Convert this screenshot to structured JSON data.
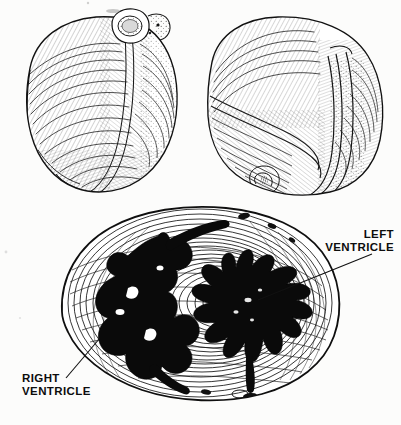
{
  "plate": {
    "title": "Heart Anatomy Illustration Plate",
    "medium": "pen-and-ink hatched anatomical drawing",
    "background_color": "#fcfcfb",
    "ink_color": "#141414",
    "cavity_fill_color": "#0a0a0a"
  },
  "figures": {
    "top_left": {
      "name": "heart-specimen-anterior",
      "description": "whole heart specimen, hatched, with cut vessel stump at upper right"
    },
    "top_right": {
      "name": "heart-specimen-posterior",
      "description": "whole heart specimen, rotated view, with folded muscle band at right"
    },
    "bottom": {
      "name": "heart-cross-section",
      "description": "transverse section of ventricles showing concentric myocardial fiber contours and two dark cavities"
    }
  },
  "labels": [
    {
      "id": "left-ventricle",
      "line1": "LEFT",
      "line2": "VENTRICLE",
      "text_x": 338,
      "text_y": 238,
      "align": "end",
      "anchor_x": 394,
      "leader": "M 372 254 L 258 300"
    },
    {
      "id": "right-ventricle",
      "line1": "RIGHT",
      "line2": "VENTRICLE",
      "text_x": 22,
      "text_y": 382,
      "align": "start",
      "anchor_x": 22,
      "leader": "M 66 378 L 100 338"
    }
  ],
  "caption": {
    "text": "",
    "visible": "cropped"
  }
}
